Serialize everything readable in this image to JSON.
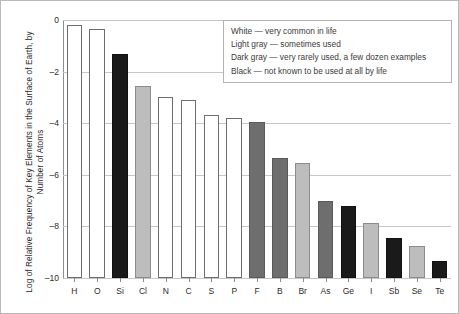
{
  "chart_data": {
    "type": "bar",
    "title": "",
    "xlabel": "",
    "ylabel": "Log of Relative Frequency of Key Elements in the Surface of Earth, by Number of Atoms",
    "categories": [
      "H",
      "O",
      "Si",
      "Cl",
      "N",
      "C",
      "S",
      "P",
      "F",
      "B",
      "Br",
      "As",
      "Ge",
      "I",
      "Sb",
      "Se",
      "Te"
    ],
    "values": [
      -0.2,
      -0.35,
      -1.3,
      -2.55,
      -3.0,
      -3.1,
      -3.7,
      -3.8,
      -3.95,
      -5.35,
      -5.55,
      -7.0,
      -7.2,
      -7.85,
      -8.45,
      -8.75,
      -9.35
    ],
    "bar_shades": [
      "white",
      "white",
      "black",
      "lightgray",
      "white",
      "white",
      "white",
      "white",
      "darkgray",
      "darkgray",
      "lightgray",
      "darkgray",
      "black",
      "lightgray",
      "black",
      "lightgray",
      "black"
    ],
    "ylim": [
      -10,
      0
    ],
    "ytick_values": [
      0,
      -2,
      -4,
      -6,
      -8,
      -10
    ],
    "ytick_labels": [
      "0",
      "–2",
      "–4",
      "–6",
      "–8",
      "–10"
    ],
    "grid": true,
    "legend_position": "top-right"
  },
  "legend": {
    "entries": [
      {
        "label": "White — very common in life",
        "shade": "white"
      },
      {
        "label": "Light gray — sometimes used",
        "shade": "lightgray"
      },
      {
        "label": "Dark gray — very rarely used, a few dozen examples",
        "shade": "darkgray"
      },
      {
        "label": "Black — not known to be used at all by life",
        "shade": "black"
      }
    ]
  },
  "colors": {
    "white": "#ffffff",
    "lightgray": "#bdbdbd",
    "darkgray": "#6e6e6e",
    "black": "#1a1a1a",
    "axis": "#8e8e8e",
    "grid": "#c6c6c6",
    "text": "#2b2b2b"
  }
}
